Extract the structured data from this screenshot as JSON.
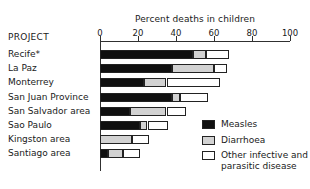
{
  "chart_data": {
    "type": "bar",
    "orientation": "horizontal",
    "stacked": true,
    "title": "Percent deaths in children",
    "xlabel": "Percent deaths in children",
    "ylabel": "PROJECT",
    "xlim": [
      0,
      100
    ],
    "xticks": [
      0,
      20,
      40,
      60,
      80,
      100
    ],
    "xtick_labels": [
      "0",
      "20",
      "40",
      "60",
      "80",
      "100"
    ],
    "grid": false,
    "legend_position": "right-bottom",
    "categories": [
      "Recife*",
      "La Paz",
      "Monterrey",
      "San Juan Province",
      "San Salvador area",
      "Sao Paulo",
      "Kingston area",
      "Santiago area"
    ],
    "series": [
      {
        "name": "Measles",
        "color": "#101010",
        "values": [
          49,
          38,
          23,
          38,
          16,
          21,
          0,
          4
        ]
      },
      {
        "name": "Diarrhoea",
        "color": "#d2d2d2",
        "values": [
          7,
          22,
          12,
          4,
          19,
          4,
          17,
          8
        ]
      },
      {
        "name": "Other infective and parasitic disease",
        "color": "#ffffff",
        "values": [
          12,
          7,
          28,
          15,
          10,
          11,
          9,
          9
        ]
      }
    ],
    "totals": [
      68,
      67,
      63,
      57,
      45,
      36,
      26,
      21
    ]
  },
  "axis": {
    "title": "Percent deaths in children",
    "ticks": [
      {
        "value": 0,
        "label": "0"
      },
      {
        "value": 20,
        "label": "20"
      },
      {
        "value": 40,
        "label": "40"
      },
      {
        "value": 60,
        "label": "60"
      },
      {
        "value": 80,
        "label": "80"
      },
      {
        "value": 100,
        "label": "100"
      }
    ]
  },
  "project_column": {
    "header": "PROJECT",
    "rows": [
      {
        "label": "Recife*"
      },
      {
        "label": "La Paz"
      },
      {
        "label": "Monterrey"
      },
      {
        "label": "San Juan Province"
      },
      {
        "label": "San Salvador area"
      },
      {
        "label": "Sao Paulo"
      },
      {
        "label": "Kingston area"
      },
      {
        "label": "Santiago area"
      }
    ]
  },
  "legend": {
    "items": [
      {
        "label": "Measles",
        "color": "#101010"
      },
      {
        "label": "Diarrhoea",
        "color": "#d2d2d2"
      },
      {
        "label": "Other infective and\nparasitic disease",
        "color": "#ffffff"
      }
    ]
  }
}
